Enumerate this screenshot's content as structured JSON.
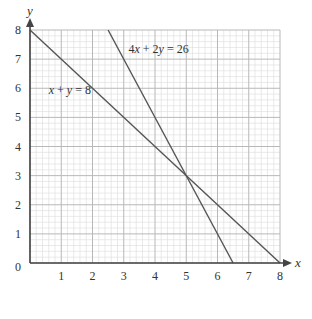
{
  "chart_data": {
    "type": "line",
    "title": "",
    "xlabel": "x",
    "ylabel": "y",
    "xlim": [
      0,
      8
    ],
    "ylim": [
      0,
      8
    ],
    "xticks": [
      0,
      1,
      2,
      3,
      4,
      5,
      6,
      7,
      8
    ],
    "yticks": [
      0,
      1,
      2,
      3,
      4,
      5,
      6,
      7,
      8
    ],
    "x_tick_labels": [
      "1",
      "2",
      "3",
      "4",
      "5",
      "6",
      "7",
      "8"
    ],
    "y_tick_labels": [
      "0",
      "1",
      "2",
      "3",
      "4",
      "5",
      "6",
      "7",
      "8"
    ],
    "grid": {
      "on": true,
      "major_step": 1,
      "minor_step": 0.2
    },
    "series": [
      {
        "name": "x + y = 8",
        "label": "x + y = 8",
        "points": [
          [
            0,
            8
          ],
          [
            8,
            0
          ]
        ],
        "label_pos": [
          0.6,
          5.8
        ]
      },
      {
        "name": "4x + 2y = 26",
        "label": "4x + 2y = 26",
        "points": [
          [
            2.5,
            8
          ],
          [
            6.5,
            0
          ]
        ],
        "label_pos": [
          3.15,
          7.2
        ]
      }
    ],
    "intersection": [
      5,
      3
    ],
    "legend": "none (inline labels)"
  },
  "colors": {
    "line": "#555555",
    "axis": "#444444",
    "grid_major": "#b8b8b8",
    "grid_minor": "#dcdcdc",
    "text": "#333333"
  }
}
